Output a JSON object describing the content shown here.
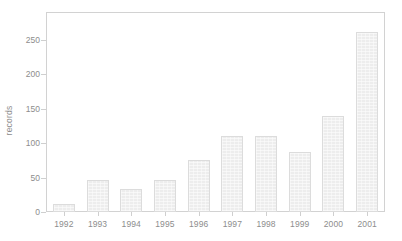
{
  "chart_data": {
    "type": "bar",
    "title": "",
    "subtitle": "",
    "xlabel": "",
    "ylabel": "records",
    "categories": [
      "1992",
      "1993",
      "1994",
      "1995",
      "1996",
      "1997",
      "1998",
      "1999",
      "2000",
      "2001"
    ],
    "values": [
      11,
      46,
      33,
      46,
      75,
      111,
      111,
      87,
      140,
      262
    ],
    "series": [
      {
        "name": "records",
        "values": [
          11,
          46,
          33,
          46,
          75,
          111,
          111,
          87,
          140,
          262
        ]
      }
    ],
    "ylim": [
      0,
      289
    ],
    "y_ticks": [
      0,
      50,
      100,
      150,
      200,
      250
    ],
    "y_tick_labels": [
      "0",
      "50",
      "100",
      "150",
      "200",
      "250"
    ],
    "x_tick_labels": [
      "1992",
      "1993",
      "1994",
      "1995",
      "1996",
      "1997",
      "1998",
      "1999",
      "2000",
      "2001"
    ],
    "grid": false,
    "legend": false,
    "legend_position": "none",
    "bar_fill_color": "#ededed",
    "bar_border_color": "#dcdcdc",
    "axis_color": "#d2d2d2",
    "text_color": "#8d8d8d",
    "background_color": "#ffffff"
  },
  "axis": {
    "y_title": "records"
  }
}
